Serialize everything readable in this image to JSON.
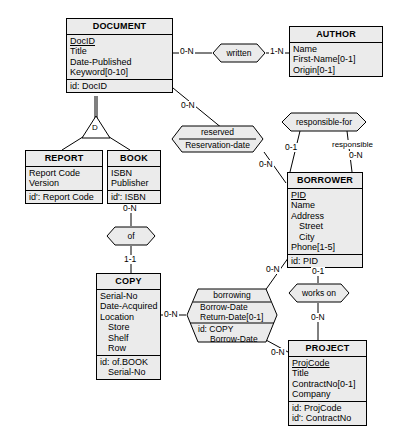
{
  "diagram": {
    "notation": "Entity-Relationship (Merise / hexagon relationships)",
    "colors": {
      "box_fill": "#ebebeb",
      "stroke": "#000000",
      "background": "#ffffff"
    }
  },
  "entities": [
    {
      "id": "document",
      "name": "DOCUMENT",
      "attributes": [
        "DocID",
        "Title",
        "Date-Published",
        "Keyword[0-10]"
      ],
      "identifiers": [
        "id: DocID"
      ]
    },
    {
      "id": "author",
      "name": "AUTHOR",
      "attributes": [
        "Name",
        "First-Name[0-1]",
        "Origin[0-1]"
      ],
      "identifiers": []
    },
    {
      "id": "report",
      "name": "REPORT",
      "attributes": [
        "Report Code",
        "Version"
      ],
      "identifiers": [
        "id': Report Code"
      ]
    },
    {
      "id": "book",
      "name": "BOOK",
      "attributes": [
        "ISBN",
        "Publisher"
      ],
      "identifiers": [
        "id': ISBN"
      ]
    },
    {
      "id": "borrower",
      "name": "BORROWER",
      "attributes": [
        "PID",
        "Name",
        "Address",
        "Street",
        "City",
        "Phone[1-5]"
      ],
      "identifiers": [
        "id: PID"
      ]
    },
    {
      "id": "copy",
      "name": "COPY",
      "attributes": [
        "Serial-No",
        "Date-Acquired",
        "Location",
        "Store",
        "Shelf",
        "Row"
      ],
      "identifiers": [
        "id: of.BOOK",
        "Serial-No"
      ]
    },
    {
      "id": "project",
      "name": "PROJECT",
      "attributes": [
        "ProjCode",
        "Title",
        "ContractNo[0-1]",
        "Company"
      ],
      "identifiers": [
        "id: ProjCode",
        "id': ContractNo"
      ]
    }
  ],
  "relationships": [
    {
      "id": "written",
      "name": "written",
      "attributes": [],
      "identifiers": []
    },
    {
      "id": "reserved",
      "name": "reserved",
      "attributes": [
        "Reservation-date"
      ],
      "identifiers": []
    },
    {
      "id": "responsible_for",
      "name": "responsible-for",
      "attributes": [],
      "identifiers": []
    },
    {
      "id": "of",
      "name": "of",
      "attributes": [],
      "identifiers": []
    },
    {
      "id": "borrowing",
      "name": "borrowing",
      "attributes": [
        "Borrow-Date",
        "Return-Date[0-1]"
      ],
      "identifiers": [
        "id: COPY",
        "Borrow-Date"
      ]
    },
    {
      "id": "works_on",
      "name": "works on",
      "attributes": [],
      "identifiers": []
    }
  ],
  "specialization": {
    "id": "doc_spec",
    "symbol": "D",
    "parent": "DOCUMENT",
    "children": [
      "REPORT",
      "BOOK"
    ]
  },
  "cardinalities": {
    "document_written": "0-N",
    "author_written": "1-N",
    "document_reserved": "0-N",
    "borrower_reserved": "0-N",
    "borrower_responsible_left": "0-1",
    "borrower_responsible_right": "0-N",
    "book_of": "0-N",
    "copy_of": "1-1",
    "copy_borrowing": "0-N",
    "borrower_borrowing": "0-N",
    "project_borrowing": "0-N",
    "borrower_works_on": "0-1",
    "project_works_on": "0-N"
  },
  "roles": {
    "responsible": "responsible"
  }
}
